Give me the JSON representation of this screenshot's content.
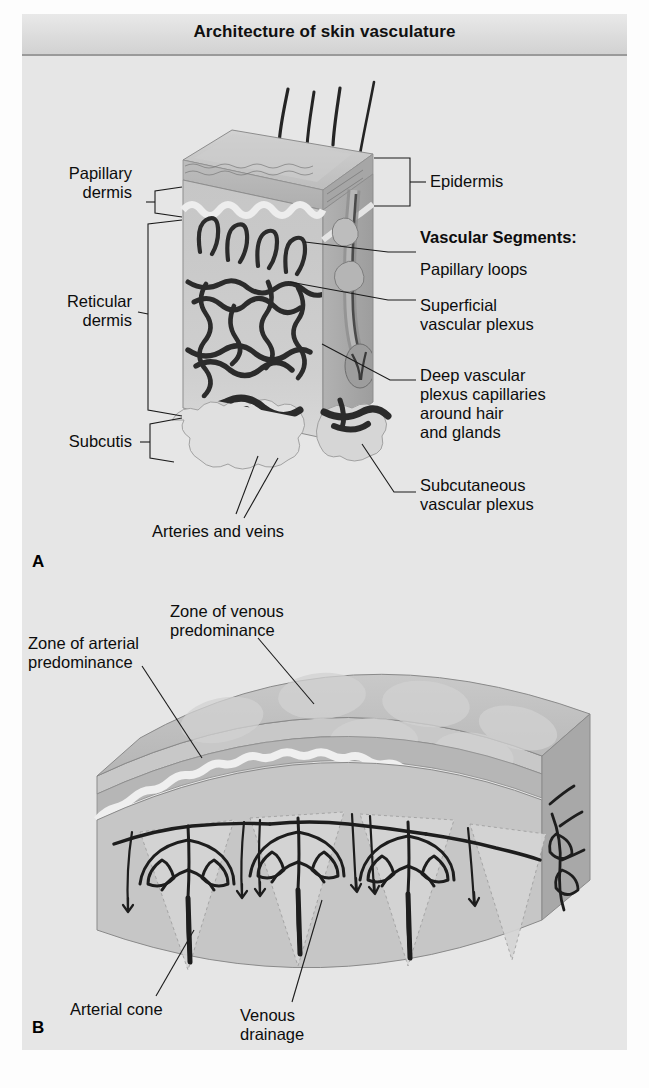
{
  "figure": {
    "title": "Architecture of skin vasculature",
    "panels": [
      {
        "letter": "A",
        "caption": "Three-dimensional block of skin showing vascular segments"
      },
      {
        "letter": "B",
        "caption": "Curved skin block showing arterial cones and venous drainage zones"
      }
    ]
  },
  "panel_a": {
    "letter": "A",
    "left_labels": [
      {
        "id": "papillary-dermis",
        "text": "Papillary\ndermis"
      },
      {
        "id": "reticular-dermis",
        "text": "Reticular\ndermis"
      },
      {
        "id": "subcutis",
        "text": "Subcutis"
      }
    ],
    "right_labels": [
      {
        "id": "epidermis",
        "text": "Epidermis"
      },
      {
        "id": "vascular-segments-heading",
        "text": "Vascular Segments:",
        "bold": true
      },
      {
        "id": "papillary-loops",
        "text": "Papillary loops"
      },
      {
        "id": "superficial-vascular-plexus",
        "text": "Superficial\nvascular plexus"
      },
      {
        "id": "deep-vascular-plexus",
        "text": "Deep vascular\nplexus capillaries\naround hair\nand glands"
      },
      {
        "id": "subcutaneous-vascular-plexus",
        "text": "Subcutaneous\nvascular plexus"
      }
    ],
    "bottom_labels": [
      {
        "id": "arteries-and-veins",
        "text": "Arteries and veins"
      }
    ]
  },
  "panel_b": {
    "letter": "B",
    "labels": [
      {
        "id": "zone-of-venous-predominance",
        "text": "Zone of venous\npredominance"
      },
      {
        "id": "zone-of-arterial-predominance",
        "text": "Zone of arterial\npredominance"
      },
      {
        "id": "arterial-cone",
        "text": "Arterial cone"
      },
      {
        "id": "venous-drainage",
        "text": "Venous\ndrainage"
      }
    ]
  },
  "colors": {
    "page_background": "#fdfdfd",
    "figure_background": "#e6e6e6",
    "title_bar": "#dcdcdc",
    "text": "#0d0d0d",
    "vessel_dark": "#2b2b2b",
    "epidermis_fill": "#b9b9b9",
    "dermis_fill": "#c9c9c9",
    "subcutis_fill": "#dadada",
    "top_face": "#c4c4c4",
    "side_face": "#a9a9a9"
  }
}
